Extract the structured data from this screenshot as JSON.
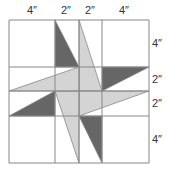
{
  "colors": {
    "dark": "#666666",
    "light": "#d4d4d4",
    "line": "#888888",
    "background": "#ffffff"
  },
  "grid": {
    "xs": [
      9,
      55,
      79,
      102,
      149
    ],
    "ys": [
      20,
      67,
      91,
      116,
      163
    ]
  },
  "top_labels": [
    {
      "text": "4″",
      "x": 27,
      "y": 5
    },
    {
      "text": "2″",
      "x": 61,
      "y": 5
    },
    {
      "text": "2″",
      "x": 85,
      "y": 5
    },
    {
      "text": "4″",
      "x": 119,
      "y": 5
    }
  ],
  "side_labels": [
    {
      "text": "4″",
      "x": 152,
      "y": 38
    },
    {
      "text": "2″",
      "x": 152,
      "y": 74
    },
    {
      "text": "2″",
      "x": 152,
      "y": 98
    },
    {
      "text": "4″",
      "x": 152,
      "y": 134
    }
  ],
  "shapes": [
    {
      "name": "blade-top",
      "fill": "light",
      "points": "79,20 102,91 79,91"
    },
    {
      "name": "blade-right",
      "fill": "light",
      "points": "149,91 79,116 79,91"
    },
    {
      "name": "blade-bottom",
      "fill": "light",
      "points": "79,163 55,91 79,91"
    },
    {
      "name": "blade-left",
      "fill": "light",
      "points": "9,91 79,67 79,91"
    },
    {
      "name": "dark-top",
      "fill": "dark",
      "points": "55,20 79,67 55,67"
    },
    {
      "name": "dark-right",
      "fill": "dark",
      "points": "149,67 102,91 102,67"
    },
    {
      "name": "dark-bottom",
      "fill": "dark",
      "points": "102,163 79,116 102,116"
    },
    {
      "name": "dark-left",
      "fill": "dark",
      "points": "9,116 55,91 55,116"
    }
  ]
}
